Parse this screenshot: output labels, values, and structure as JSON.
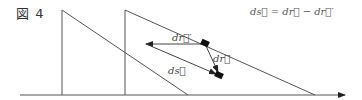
{
  "figure": {
    "label": "図 4",
    "formula": "ds⃗ = dr⃗ − dr⃗′"
  },
  "labels": {
    "dr_prime": "dr⃗′",
    "dr": "dr⃗",
    "ds": "ds⃗"
  },
  "colors": {
    "line": "#555555",
    "marker": "#111111",
    "arrow": "#222222"
  }
}
